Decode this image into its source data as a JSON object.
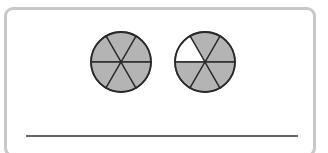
{
  "worksheet": {
    "frame": {
      "border_color": "#c8c8c8"
    },
    "fraction_circles": [
      {
        "id": "circle-1",
        "cx": 121,
        "cy": 62,
        "r": 30,
        "parts": 6,
        "shaded_parts": 6,
        "unshaded_sectors": []
      },
      {
        "id": "circle-2",
        "cx": 205,
        "cy": 62,
        "r": 30,
        "parts": 6,
        "shaded_parts": 5,
        "unshaded_sectors": [
          2
        ]
      }
    ],
    "colors": {
      "shaded": "#b4b4b4",
      "unshaded": "#ffffff",
      "outline": "#2a2a2a",
      "answer_line": "#333333"
    },
    "answer_line": {
      "x1": 26,
      "x2": 298,
      "y": 136
    }
  }
}
